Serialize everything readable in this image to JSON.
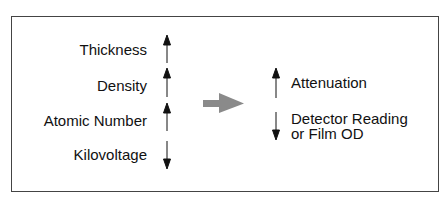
{
  "left_factors": [
    {
      "label": "Thickness",
      "direction": "up"
    },
    {
      "label": "Density",
      "direction": "up"
    },
    {
      "label": "Atomic Number",
      "direction": "up"
    },
    {
      "label": "Kilovoltage",
      "direction": "down"
    }
  ],
  "center_arrow": {
    "icon": "right-arrow-icon",
    "color": "#8a8a8a"
  },
  "right_effects": [
    {
      "label": "Attenuation",
      "direction": "up"
    },
    {
      "label_line1": "Detector Reading",
      "label_line2": "or Film OD",
      "direction": "down"
    }
  ]
}
